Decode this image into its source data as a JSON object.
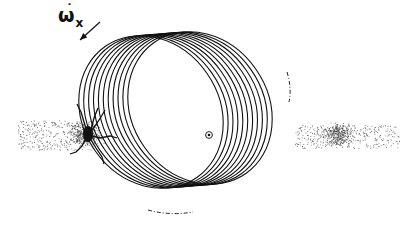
{
  "diagram": {
    "type": "precessing-orbit-ellipses",
    "label": {
      "symbol": "ω",
      "dot": "˙",
      "subscript": "x",
      "text": "ω̇x"
    },
    "arrow": {
      "from": [
        100,
        22
      ],
      "to": [
        80,
        40
      ],
      "direction": "down-left"
    },
    "center_marker": {
      "x": 209,
      "y": 135,
      "style": "dot-in-circle"
    },
    "ellipse_family": {
      "count": 11,
      "rx": 68,
      "ry": 80,
      "rotation_deg": -35,
      "center_start": [
        200,
        108
      ],
      "center_end": [
        151,
        112
      ],
      "stroke": "#111111"
    },
    "particle_clouds": [
      {
        "name": "left-cloud",
        "x_range": [
          18,
          95
        ],
        "y_range": [
          120,
          150
        ],
        "dense_at": [
          85,
          135
        ]
      },
      {
        "name": "right-cloud",
        "x_range": [
          295,
          400
        ],
        "y_range": [
          125,
          148
        ],
        "dense_at": [
          338,
          134
        ]
      }
    ],
    "dashed_tails": [
      {
        "name": "upper-right-tail",
        "x": 290,
        "y_range": [
          78,
          100
        ]
      },
      {
        "name": "bottom-tail",
        "x_range": [
          150,
          192
        ],
        "y": 214
      }
    ],
    "colors": {
      "ink": "#111111",
      "background": "#ffffff",
      "speckle": "#444444"
    }
  }
}
